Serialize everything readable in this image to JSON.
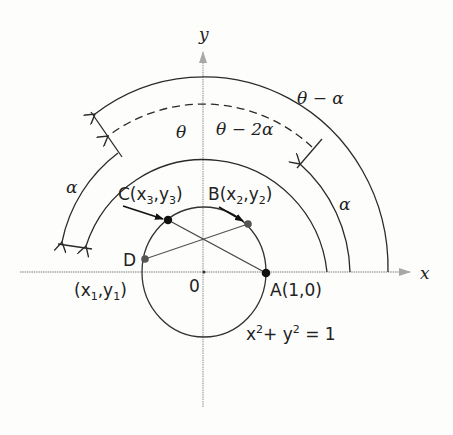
{
  "diagram": {
    "type": "unit-circle-angle-diagram",
    "axes": {
      "x_label": "x",
      "y_label": "y",
      "origin_label": "0"
    },
    "circle": {
      "equation_x": "x",
      "equation_y": "y",
      "equation_exp": "2",
      "equation_rhs": "+ ",
      "equation_eq": " = 1",
      "equation": "x^2 + y^2 = 1"
    },
    "points": {
      "A": {
        "label": "A(1,0)"
      },
      "B": {
        "prefix": "B(x",
        "sub1": "2",
        "mid": ",y",
        "sub2": "2",
        "suffix": ")"
      },
      "C": {
        "prefix": "C(x",
        "sub1": "3",
        "mid": ",y",
        "sub2": "3",
        "suffix": ")"
      },
      "D": {
        "label": "D",
        "prefix": "(x",
        "sub1": "1",
        "mid": ",y",
        "sub2": "1",
        "suffix": ")"
      }
    },
    "arc_labels": {
      "theta": "θ",
      "theta_minus_alpha": "θ − α",
      "theta_minus_2alpha": "θ − 2α",
      "alpha_left": "α",
      "alpha_right": "α"
    },
    "colors": {
      "axis": "#a8a8a8",
      "line": "#2a2a2a",
      "text": "#222222"
    }
  }
}
